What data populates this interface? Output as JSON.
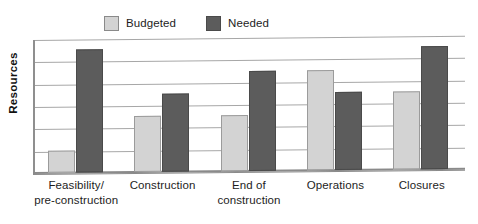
{
  "chart_data": {
    "type": "bar",
    "title": "",
    "subtitle": "",
    "xlabel": "",
    "ylabel": "Resources",
    "grid": true,
    "gridline_count": 6,
    "ylim": [
      0,
      6
    ],
    "y_tick_labels": [],
    "legend_position": "top-center",
    "categories": [
      "Feasibility/ pre-construction",
      "Construction",
      "End of construction",
      "Operations",
      "Closures"
    ],
    "category_lines": [
      [
        "Feasibility/",
        "pre-construction"
      ],
      [
        "Construction",
        ""
      ],
      [
        "End of",
        "construction"
      ],
      [
        "Operations",
        ""
      ],
      [
        "Closures",
        ""
      ]
    ],
    "series": [
      {
        "name": "Budgeted",
        "color": "#d3d3d3",
        "values": [
          1.0,
          2.5,
          2.5,
          4.5,
          3.5
        ]
      },
      {
        "name": "Needed",
        "color": "#5c5c5c",
        "values": [
          5.5,
          3.5,
          4.5,
          3.5,
          5.5
        ]
      }
    ],
    "annotations": []
  },
  "legend": {
    "entries": [
      {
        "label": "Budgeted",
        "swatch": "legend-swatch-budgeted"
      },
      {
        "label": "Needed",
        "swatch": "legend-swatch-needed"
      }
    ]
  },
  "axes": {
    "y_title": "Resources"
  }
}
